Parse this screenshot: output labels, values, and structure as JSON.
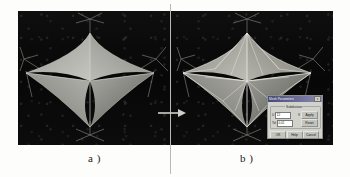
{
  "figure": {
    "caption_a": "a )",
    "caption_b": "b )",
    "arrow_name": "transition-arrow"
  },
  "panel_a": {
    "label": "a )",
    "description": "Dark rendered view of a four-point star tensile membrane tent structure with smooth shaded surface and supporting cable guys."
  },
  "panel_b": {
    "label": "b )",
    "description": "Dark rendered view of the same four-point star tensile membrane tent structure with triangulated wireframe mesh lines visible and a settings dialog overlay."
  },
  "dialog": {
    "title": "Mesh Parameters",
    "close_label": "x",
    "group_label": "Subdivision",
    "field_u_label": "U",
    "field_u_value": "12",
    "field_v_label": "V",
    "field_v_value": "12",
    "field_tol_label": "Tol",
    "field_tol_value": "0.01",
    "btn_apply": "Apply",
    "btn_reset": "Reset",
    "btn_ok": "OK",
    "btn_help": "Help",
    "btn_cancel": "Cancel"
  },
  "colors": {
    "canvas_bg": "#0a0a0a",
    "membrane_light": "#b9b9b4",
    "membrane_mid": "#8d8d88",
    "membrane_dark": "#5a5a56",
    "cable": "#9a9a95",
    "divider": "#b9b9b4",
    "page_bg": "#fdfdfb",
    "dialog_face": "#d2d2cc",
    "dialog_title": "#4a4a78"
  }
}
